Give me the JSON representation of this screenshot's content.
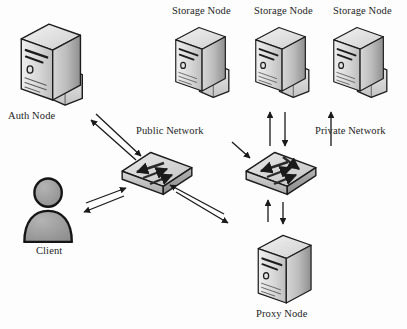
{
  "diagram": {
    "background_color": "#fdfdfd",
    "line_color": "#1a1a1a",
    "labels": {
      "auth_node": "Auth Node",
      "client": "Client",
      "public_network": "Public Network",
      "private_network": "Private Network",
      "proxy_node": "Proxy Node",
      "storage_node_1": "Storage Node",
      "storage_node_2": "Storage Node",
      "storage_node_3": "Storage Node"
    },
    "nodes": [
      {
        "id": "auth-node",
        "type": "server",
        "label": "Auth Node",
        "x": 18,
        "y": 22,
        "w": 72,
        "h": 86,
        "label_x": 8,
        "label_y": 112,
        "has_folder": true
      },
      {
        "id": "storage-node-1",
        "type": "server",
        "label": "Storage Node",
        "x": 175,
        "y": 26,
        "w": 56,
        "h": 72,
        "label_x": 172,
        "label_y": 8,
        "has_folder": true
      },
      {
        "id": "storage-node-2",
        "type": "server",
        "label": "Storage Node",
        "x": 256,
        "y": 26,
        "w": 56,
        "h": 72,
        "label_x": 254,
        "label_y": 8,
        "has_folder": true
      },
      {
        "id": "storage-node-3",
        "type": "server",
        "label": "Storage Node",
        "x": 334,
        "y": 26,
        "w": 56,
        "h": 72,
        "label_x": 332,
        "label_y": 8,
        "has_folder": true
      },
      {
        "id": "proxy-node",
        "type": "server",
        "label": "Proxy Node",
        "x": 252,
        "y": 232,
        "w": 60,
        "h": 76,
        "label_x": 256,
        "label_y": 310,
        "has_folder": false
      },
      {
        "id": "client",
        "type": "person",
        "label": "Client",
        "x": 20,
        "y": 178,
        "w": 60,
        "h": 66,
        "label_x": 37,
        "label_y": 248
      },
      {
        "id": "public-switch",
        "type": "switch",
        "label": "Public Network",
        "x": 122,
        "y": 152,
        "w": 62,
        "h": 38,
        "label_x": 138,
        "label_y": 128,
        "arrows": 3
      },
      {
        "id": "private-switch",
        "type": "switch",
        "label": "Private Network",
        "x": 246,
        "y": 152,
        "w": 62,
        "h": 38,
        "label_x": 316,
        "label_y": 128,
        "arrows": 4
      }
    ],
    "connections": [
      {
        "from": "auth-node",
        "to": "public-switch",
        "direction": "bidirectional",
        "style": "diagonal"
      },
      {
        "from": "client",
        "to": "public-switch",
        "direction": "bidirectional",
        "style": "diagonal"
      },
      {
        "from": "public-switch",
        "to": "proxy-node",
        "direction": "bidirectional",
        "style": "diagonal"
      },
      {
        "from": "private-switch",
        "to": "proxy-node",
        "direction": "bidirectional",
        "style": "vertical"
      },
      {
        "from": "storage-node-1",
        "to": "private-switch",
        "direction": "bidirectional",
        "style": "diagonal"
      },
      {
        "from": "storage-node-2",
        "to": "private-switch",
        "direction": "bidirectional",
        "style": "vertical"
      },
      {
        "from": "storage-node-3",
        "to": "private-switch",
        "direction": "bidirectional",
        "style": "vertical"
      }
    ]
  }
}
